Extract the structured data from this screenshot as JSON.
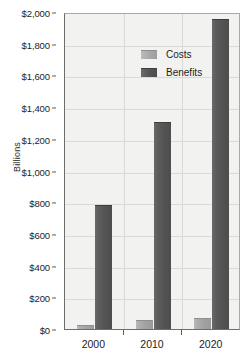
{
  "chart_data": {
    "type": "bar",
    "title": "",
    "xlabel": "",
    "ylabel": "Billions",
    "categories": [
      "2000",
      "2010",
      "2020"
    ],
    "series": [
      {
        "name": "Costs",
        "values": [
          25,
          60,
          70
        ],
        "color": "#a6a6a6"
      },
      {
        "name": "Benefits",
        "values": [
          780,
          1305,
          1955
        ],
        "color": "#555555"
      }
    ],
    "ylim": [
      0,
      2000
    ],
    "y_ticks": [
      0,
      200,
      400,
      600,
      800,
      1000,
      1200,
      1400,
      1600,
      1800,
      2000
    ],
    "y_tick_labels": [
      "$0",
      "$200",
      "$400",
      "$600",
      "$800",
      "$1,000",
      "$1,200",
      "$1,400",
      "$1,600",
      "$1,800",
      "$2,000"
    ],
    "grid": true,
    "legend_position": "top-left",
    "legend": [
      "Costs",
      "Benefits"
    ]
  },
  "axes": {
    "y_title": "Billions"
  },
  "legend": {
    "items": [
      {
        "label": "Costs"
      },
      {
        "label": "Benefits"
      }
    ]
  }
}
